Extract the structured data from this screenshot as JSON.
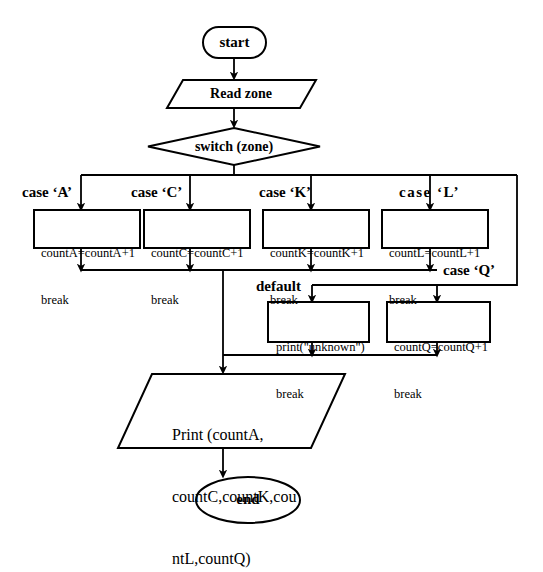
{
  "diagram": {
    "colors": {
      "stroke": "#000000",
      "fill": "#ffffff",
      "background": "#ffffff"
    },
    "nodes": {
      "start": {
        "label": "start",
        "shape": "terminal"
      },
      "read": {
        "label": "Read zone",
        "shape": "parallelogram"
      },
      "switch": {
        "label": "switch (zone)",
        "shape": "diamond"
      },
      "caseA": {
        "line1": "countA=countA+1",
        "line2": "break",
        "shape": "process"
      },
      "caseC": {
        "line1": "countC=countC+1",
        "line2": "break",
        "shape": "process"
      },
      "caseK": {
        "line1": "countK=countK+1",
        "line2": "break",
        "shape": "process"
      },
      "caseL": {
        "line1": "countL=countL+1",
        "line2": "break",
        "shape": "process"
      },
      "defaultBox": {
        "line1": "print(\"unknown\")",
        "line2": "break",
        "shape": "process"
      },
      "caseQ": {
        "line1": "countQ=countQ+1",
        "line2": "break",
        "shape": "process"
      },
      "print": {
        "line1": "Print (countA,",
        "line2": "countC,countK,cou",
        "line3": "ntL,countQ)",
        "shape": "parallelogram"
      },
      "end": {
        "label": "end",
        "shape": "terminal"
      }
    },
    "edge_labels": {
      "caseA": "case ‘A’",
      "caseC": "case ‘C’",
      "caseK": "case ‘K’",
      "caseL": "case ‘L’",
      "caseQ": "case ‘Q’",
      "default": "default"
    }
  }
}
